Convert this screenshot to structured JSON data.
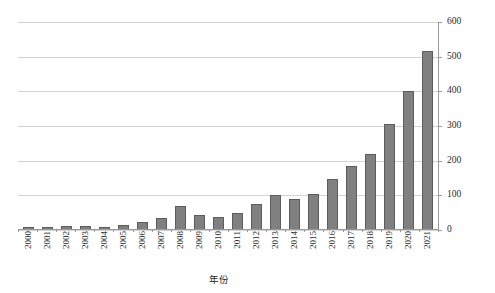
{
  "chart_data": {
    "type": "bar",
    "title": "",
    "xlabel": "年份",
    "ylabel": "",
    "ylim": [
      0,
      600
    ],
    "yticks": [
      0,
      100,
      200,
      300,
      400,
      500,
      600
    ],
    "grid": true,
    "legend": null,
    "y_axis_position": "right",
    "x_label_rotation": "vertical",
    "categories": [
      "2000",
      "2001",
      "2002",
      "2003",
      "2004",
      "2005",
      "2006",
      "2007",
      "2008",
      "2009",
      "2010",
      "2011",
      "2012",
      "2013",
      "2014",
      "2015",
      "2016",
      "2017",
      "2018",
      "2019",
      "2020",
      "2021"
    ],
    "values": [
      8,
      10,
      11,
      11,
      10,
      15,
      22,
      35,
      68,
      42,
      38,
      48,
      75,
      100,
      90,
      105,
      148,
      185,
      218,
      305,
      400,
      515
    ],
    "series": [
      {
        "name": "发文量",
        "values": [
          8,
          10,
          11,
          11,
          10,
          15,
          22,
          35,
          68,
          42,
          38,
          48,
          75,
          100,
          90,
          105,
          148,
          185,
          218,
          305,
          400,
          515
        ]
      }
    ]
  },
  "axis": {
    "x_title": "年份",
    "y_tick_labels": [
      "600",
      "500",
      "400",
      "300",
      "200",
      "100",
      "0"
    ]
  },
  "colors": {
    "bar_fill": "#808080",
    "bar_border": "#5c5c5c",
    "gridline": "#d4d4d4",
    "axis_line": "#9a9a9a",
    "text": "#2b2b2b",
    "background": "#ffffff"
  },
  "caption": {
    "text": ""
  }
}
